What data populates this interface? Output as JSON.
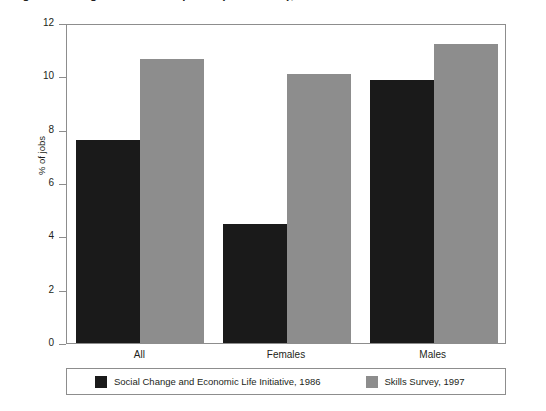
{
  "figure": {
    "caption_clipped": "Figure 1  Change in use of computers (all workers), 1986-1997"
  },
  "chart_data": {
    "type": "bar",
    "title": "",
    "xlabel": "",
    "ylabel": "% of jobs",
    "categories": [
      "All",
      "Females",
      "Males"
    ],
    "series": [
      {
        "name": "Social Change and Economic Life Initiative, 1986",
        "color": "#1a1a1a",
        "values": [
          7.6,
          4.45,
          9.85
        ]
      },
      {
        "name": "Skills Survey, 1997",
        "color": "#8d8d8d",
        "values": [
          10.65,
          10.1,
          11.2
        ]
      }
    ],
    "ylim": [
      0,
      12
    ],
    "yticks": [
      0,
      2,
      4,
      6,
      8,
      10,
      12
    ],
    "ytick_labels": [
      "0",
      "2",
      "4",
      "6",
      "8",
      "10",
      "12"
    ],
    "grid": false,
    "legend_position": "bottom"
  }
}
